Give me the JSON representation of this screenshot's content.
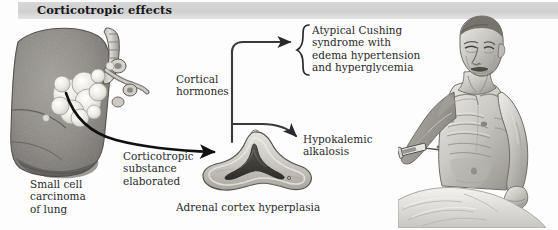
{
  "header": {
    "title": "Corticotropic effects",
    "band_color": "#d4d4d4"
  },
  "labels": {
    "cortical_hormones": "Cortical\nhormones",
    "atypical_cushing": "Atypical Cushing\nsyndrome with\nedema hypertension\nand hyperglycemia",
    "hypokalemic_alkalosis": "Hypokalemic\nalkalosis",
    "corticotropic_substance": "Corticotropic\nsubstance\nelaborated",
    "small_cell_carcinoma": "Small cell\ncarcinoma\nof lung",
    "adrenal_cortex_hyperplasia": "Adrenal cortex hyperplasia"
  },
  "illustrations": {
    "lung": {
      "name": "small-cell-carcinoma-lung",
      "description": "Coronal cut section of lung with central white lobulated tumor mass at the hilum",
      "tissue_color": "#8e8c88",
      "tumor_color": "#efeee9"
    },
    "adrenal": {
      "name": "adrenal-cortex-hyperplasia",
      "description": "Cut section of triangular adrenal gland showing thickened hyperplastic cortex",
      "cortex_color": "#c9c7c2",
      "medulla_color": "#4a4845"
    },
    "patient": {
      "name": "emaciated-patient",
      "description": "Seated emaciated elderly male, bare torso, syringe in left arm, draped sheet at waist",
      "skin_color": "#cfcdc9"
    }
  },
  "arrows": {
    "lung_to_adrenal": "Corticotropic substance travels from lung tumor to adrenal cortex",
    "adrenal_to_cushing": "Cortical hormones produce atypical Cushing syndrome",
    "adrenal_to_alkalosis": "Cortical hormones produce hypokalemic alkalosis",
    "brace": "{",
    "color": "#1c1c1c"
  },
  "colors": {
    "background": "#fdfdfd",
    "text": "#2a2a2c",
    "header_text": "#16171a"
  }
}
